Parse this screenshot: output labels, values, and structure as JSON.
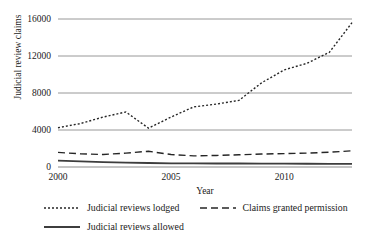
{
  "chart_data": {
    "type": "line",
    "title": "",
    "xlabel": "Year",
    "ylabel": "Judicial review claims",
    "xlim": [
      2000,
      2013
    ],
    "ylim": [
      0,
      16000
    ],
    "xticks": [
      2000,
      2005,
      2010
    ],
    "yticks": [
      0,
      4000,
      8000,
      12000,
      16000
    ],
    "grid": true,
    "legend_position": "bottom",
    "x": [
      2000,
      2001,
      2002,
      2003,
      2004,
      2005,
      2006,
      2007,
      2008,
      2009,
      2010,
      2011,
      2012,
      2013
    ],
    "series": [
      {
        "name": "Judicial reviews lodged",
        "style": "dotted",
        "color": "#262626",
        "values": [
          4250,
          4700,
          5400,
          5950,
          4200,
          5400,
          6500,
          6800,
          7200,
          9100,
          10500,
          11200,
          12400,
          15600
        ]
      },
      {
        "name": "Claims granted permission",
        "style": "dashed",
        "color": "#262626",
        "values": [
          1580,
          1420,
          1350,
          1500,
          1700,
          1350,
          1200,
          1250,
          1320,
          1400,
          1450,
          1500,
          1600,
          1750
        ]
      },
      {
        "name": "Judicial reviews allowed",
        "style": "solid",
        "color": "#3d3d3d",
        "values": [
          700,
          600,
          520,
          470,
          430,
          400,
          390,
          380,
          380,
          370,
          360,
          350,
          340,
          330
        ]
      }
    ]
  },
  "legend": {
    "items": [
      {
        "label": "Judicial reviews lodged",
        "style": "dotted"
      },
      {
        "label": "Claims granted permission",
        "style": "dashed"
      },
      {
        "label": "Judicial reviews allowed",
        "style": "solid"
      }
    ]
  }
}
